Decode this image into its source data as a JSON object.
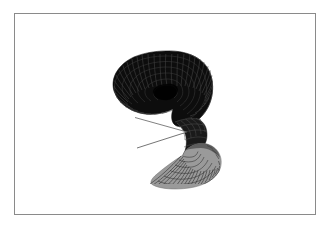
{
  "page": {
    "background_color": "#ffffff",
    "width": 332,
    "height": 231
  },
  "figure": {
    "frame": {
      "border_color": "#8a8a8a",
      "border_width_px": 1,
      "background_color": "#ffffff",
      "left": 14,
      "top": 13,
      "width": 302,
      "height": 202
    },
    "caption": "",
    "title": "",
    "axis_labels": {
      "x": "",
      "y": "",
      "z": ""
    },
    "tick_labels": [],
    "legend": [],
    "annotations": []
  },
  "chart_data": {
    "type": "line",
    "title": "",
    "subtitle": "",
    "xlabel": "",
    "ylabel": "",
    "grid": false,
    "legend_position": "none",
    "render_style": "3d-wireframe-mesh",
    "surface": {
      "parametric": true,
      "u_range": [
        0,
        6.2832
      ],
      "v_range": [
        -1,
        1
      ],
      "u_steps": 48,
      "v_steps": 14
    },
    "parts": [
      {
        "name": "upper-funnel",
        "fill_color": "#0d0d0d",
        "stroke_color": "#3a3a3a",
        "center_x": 163,
        "center_y": 78,
        "radius_x": 52,
        "radius_y": 30,
        "rib_count": 44,
        "ring_count": 7,
        "opening_direction": "up-left"
      },
      {
        "name": "neck",
        "fill_color": "#1a1a1a",
        "stroke_color": "#4a4a4a",
        "center_x": 181,
        "center_y": 120,
        "radius_x": 13,
        "radius_y": 8,
        "rib_count": 30,
        "ring_count": 5,
        "opening_direction": "twist"
      },
      {
        "name": "lower-funnel",
        "fill_color": "#9a9a9a",
        "stroke_color": "#2e2e2e",
        "center_x": 177,
        "center_y": 150,
        "radius_x": 46,
        "radius_y": 24,
        "rib_count": 44,
        "ring_count": 7,
        "opening_direction": "down-right"
      },
      {
        "name": "white-wedge-notch",
        "fill_color": "#ffffff",
        "apex_x": 172,
        "apex_y": 118,
        "left_x": 122,
        "top_y": 104,
        "bottom_y": 133
      }
    ],
    "bounds": {
      "left": 112,
      "right": 210,
      "top": 50,
      "bottom": 176
    },
    "colors": {
      "dark_surface": "#0d0d0d",
      "light_surface": "#9a9a9a",
      "mesh_line": "#2e2e2e",
      "background": "#ffffff",
      "frame": "#8a8a8a"
    }
  }
}
